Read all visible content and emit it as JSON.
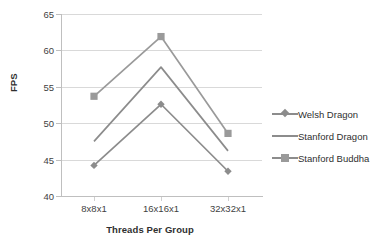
{
  "chart_data": {
    "type": "line",
    "title": "",
    "xlabel": "Threads Per Group",
    "ylabel": "FPS",
    "categories": [
      "8x8x1",
      "16x16x1",
      "32x32x1"
    ],
    "ylim": [
      40,
      65
    ],
    "yticks": [
      40,
      45,
      50,
      55,
      60,
      65
    ],
    "grid": true,
    "legend_position": "right",
    "series": [
      {
        "name": "Welsh Dragon",
        "marker": "diamond",
        "color": "#8c8c8c",
        "values": [
          44.2,
          52.6,
          43.4
        ]
      },
      {
        "name": "Stanford Dragon",
        "marker": "none",
        "color": "#8c8c8c",
        "values": [
          47.5,
          57.7,
          46.2
        ]
      },
      {
        "name": "Stanford Buddha",
        "marker": "square",
        "color": "#9a9a9a",
        "values": [
          53.7,
          61.9,
          48.6
        ]
      }
    ]
  },
  "axis": {
    "y_tick_labels": [
      "65",
      "60",
      "55",
      "50",
      "45",
      "40"
    ],
    "x_tick_labels": [
      "8x8x1",
      "16x16x1",
      "32x32x1"
    ],
    "y_title": "FPS",
    "x_title": "Threads Per Group"
  },
  "legend": {
    "items": [
      {
        "label": "Welsh Dragon"
      },
      {
        "label": "Stanford Dragon"
      },
      {
        "label": "Stanford Buddha"
      }
    ]
  },
  "colors": {
    "series_gray": "#8c8c8c",
    "series_gray_light": "#9a9a9a",
    "gridline": "#d9d9d9",
    "axis": "#bfbfbf",
    "text": "#3f3f3f"
  }
}
